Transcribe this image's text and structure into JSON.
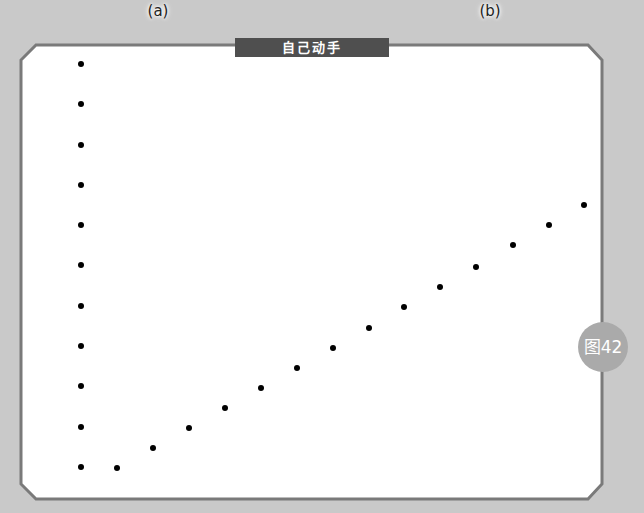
{
  "labels": {
    "a": "(a)",
    "b": "(b)"
  },
  "panel": {
    "title": "自己动手",
    "badge": "图42"
  },
  "colors": {
    "background": "#c9c9c9",
    "panel_border": "#7a7a7a",
    "tab": "#4f4f4f",
    "badge": "#aaaaaa",
    "dot": "#000000"
  },
  "dots": {
    "column_a": [
      [
        81,
        64
      ],
      [
        81,
        104
      ],
      [
        81,
        145
      ],
      [
        81,
        185
      ],
      [
        81,
        225
      ],
      [
        81,
        265
      ],
      [
        81,
        306
      ],
      [
        81,
        346
      ],
      [
        81,
        386
      ],
      [
        81,
        427
      ],
      [
        81,
        467
      ]
    ],
    "diagonal_b": [
      [
        117,
        468
      ],
      [
        153,
        448
      ],
      [
        189,
        428
      ],
      [
        225,
        408
      ],
      [
        261,
        388
      ],
      [
        297,
        368
      ],
      [
        333,
        348
      ],
      [
        369,
        328
      ],
      [
        404,
        307
      ],
      [
        440,
        287
      ],
      [
        476,
        267
      ],
      [
        513,
        245
      ],
      [
        549,
        225
      ],
      [
        584,
        205
      ]
    ]
  }
}
